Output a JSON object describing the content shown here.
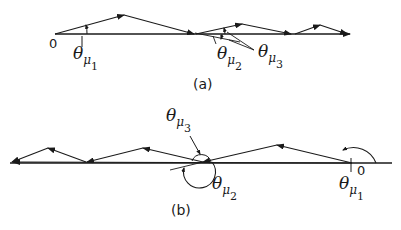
{
  "panels": {
    "a": {
      "caption": "(a)",
      "origin_label": "0",
      "angle_labels": {
        "theta1": {
          "symbol": "θ",
          "sub": "μ",
          "index": "1"
        },
        "theta2": {
          "symbol": "θ",
          "sub": "μ",
          "index": "2"
        },
        "theta3": {
          "symbol": "θ",
          "sub": "μ",
          "index": "3"
        }
      }
    },
    "b": {
      "caption": "(b)",
      "origin_label": "0",
      "angle_labels": {
        "theta1": {
          "symbol": "θ",
          "sub": "μ",
          "index": "1"
        },
        "theta2": {
          "symbol": "θ",
          "sub": "μ",
          "index": "2"
        },
        "theta3": {
          "symbol": "θ",
          "sub": "μ",
          "index": "3"
        }
      }
    }
  },
  "colors": {
    "ink": "#1a1a1a",
    "background": "#ffffff"
  }
}
